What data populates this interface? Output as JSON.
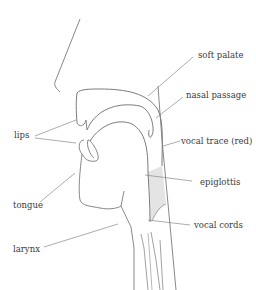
{
  "colors": {
    "outline": "#7a7a7a",
    "leader": "#8a8a8a",
    "vocal_tract_fill": "#e6e6e6",
    "label_text": "#3a3a3a"
  },
  "labels": {
    "soft_palate": "soft palate",
    "nasal_passage": "nasal passage",
    "vocal_trace": "vocal trace (red)",
    "lips": "lips",
    "epiglottis": "epiglottis",
    "tongue": "tongue",
    "vocal_cords": "vocal cords",
    "larynx": "larynx"
  }
}
